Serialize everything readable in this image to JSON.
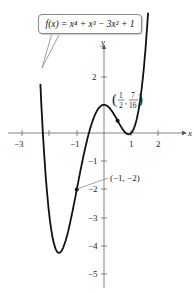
{
  "chart_data": {
    "type": "line",
    "function": "x^4 + x^3 - 3x^2 + 1",
    "xlabel": "x",
    "ylabel": "y",
    "xlim": [
      -3.5,
      2.8
    ],
    "ylim": [
      -5.5,
      3.3
    ],
    "x_ticks": [
      -3,
      -2,
      -1,
      1,
      2
    ],
    "x_tick_labels": [
      "-3",
      "-1",
      "1",
      "2"
    ],
    "y_ticks": [
      2,
      1,
      -1,
      -2,
      -3,
      -4,
      -5
    ],
    "y_tick_labels": [
      "2",
      "-1",
      "-2",
      "-3",
      "-4",
      "-5"
    ],
    "grid": false,
    "points": [
      {
        "x": 0.5,
        "y": 0.4375,
        "label": "(1/2, 7/16)"
      },
      {
        "x": -1,
        "y": -2,
        "label": "(-1, -2)"
      }
    ],
    "curve_samples": [
      {
        "x": -2.3,
        "y": 2.11
      },
      {
        "x": -2,
        "y": -3
      },
      {
        "x": -1.5,
        "y": -4.06
      },
      {
        "x": -1,
        "y": -2
      },
      {
        "x": 0,
        "y": 1
      },
      {
        "x": 0.5,
        "y": 0.4375
      },
      {
        "x": 1,
        "y": 0
      },
      {
        "x": 1.5,
        "y": 1.69
      }
    ]
  },
  "callout": {
    "text_prefix": "f(x) = x",
    "text": "f(x) = x⁴ + x³ − 3x² + 1"
  },
  "axes": {
    "x_label": "x",
    "y_label": "y"
  },
  "ticks": {
    "x": [
      "−3",
      "−1",
      "1",
      "2"
    ],
    "y": [
      "2",
      "−1",
      "−2",
      "−3",
      "−4",
      "−5"
    ]
  },
  "annotations": {
    "point1": {
      "label_open": "(",
      "num1": "1",
      "den1": "2",
      "num2": "7",
      "den2": "16",
      "label_close": ")"
    },
    "point2": "(−1, −2)"
  }
}
